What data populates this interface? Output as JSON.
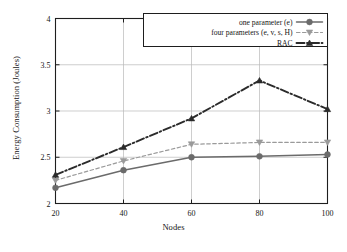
{
  "chart_data": {
    "type": "line",
    "title": "",
    "xlabel": "Nodes",
    "ylabel": "Energy Consumption (Joules)",
    "x": [
      20,
      40,
      60,
      80,
      100
    ],
    "xticklabels": [
      "20",
      "40",
      "60",
      "80",
      "100"
    ],
    "yticklabels": [
      "2",
      "2.5",
      "3",
      "3.5",
      "4"
    ],
    "yticks": [
      2,
      2.5,
      3,
      3.5,
      4
    ],
    "xlim": [
      20,
      100
    ],
    "ylim": [
      2,
      4
    ],
    "grid": true,
    "legend_position": "top-right",
    "series": [
      {
        "name": "one parameter (e)",
        "values": [
          2.17,
          2.36,
          2.5,
          2.51,
          2.53
        ],
        "color": "#6b6b6b",
        "marker": "circle",
        "dash": "solid"
      },
      {
        "name": "four parameters (e, v, s, H)",
        "values": [
          2.25,
          2.46,
          2.64,
          2.66,
          2.66
        ],
        "color": "#9a9a9a",
        "marker": "triangle-down",
        "dash": "dashed"
      },
      {
        "name": "RAC",
        "values": [
          2.31,
          2.61,
          2.92,
          3.33,
          3.02
        ],
        "color": "#2b2b2b",
        "marker": "triangle-up",
        "dash": "dashdot"
      }
    ]
  },
  "legend": {
    "entries": [
      {
        "label": "one parameter (e)"
      },
      {
        "label": "four parameters (e, v, s, H)"
      },
      {
        "label": "RAC"
      }
    ]
  },
  "axes": {
    "x_title": "Nodes",
    "y_title": "Energy Consumption (Joules)"
  }
}
